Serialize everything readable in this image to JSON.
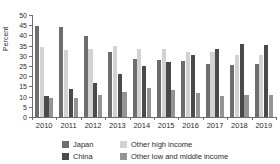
{
  "chart_data": {
    "type": "bar",
    "title": "",
    "subtitle": "",
    "xlabel": "",
    "ylabel": "Percent",
    "ylim": [
      0,
      50
    ],
    "ytick_step": 5,
    "yticks": [
      0,
      5,
      10,
      15,
      20,
      25,
      30,
      35,
      40,
      45,
      50
    ],
    "grid": false,
    "legend_position": "bottom",
    "categories": [
      "2010",
      "2011",
      "2012",
      "2013",
      "2014",
      "2015",
      "2016",
      "2017",
      "2018",
      "2019"
    ],
    "series": [
      {
        "name": "Japan",
        "color": "#6e6e6e",
        "values": [
          44.5,
          44.0,
          39.5,
          32.0,
          28.5,
          28.0,
          27.5,
          26.0,
          25.5,
          26.0
        ]
      },
      {
        "name": "Other high income",
        "color": "#d2d2d2",
        "values": [
          34.5,
          33.0,
          33.5,
          35.0,
          33.5,
          33.5,
          32.0,
          32.0,
          30.5,
          30.5
        ]
      },
      {
        "name": "China",
        "color": "#4a4a4a",
        "values": [
          10.5,
          13.5,
          16.5,
          21.0,
          25.0,
          27.0,
          30.5,
          33.5,
          36.0,
          35.5
        ]
      },
      {
        "name": "Other low and middle income",
        "color": "#949494",
        "values": [
          9.5,
          9.5,
          11.0,
          12.5,
          14.0,
          13.0,
          12.0,
          10.5,
          11.0,
          11.0
        ]
      }
    ]
  },
  "legend": {
    "items": [
      {
        "label": "Japan",
        "color": "#6e6e6e"
      },
      {
        "label": "Other high income",
        "color": "#d2d2d2"
      },
      {
        "label": "China",
        "color": "#4a4a4a"
      },
      {
        "label": "Other low and middle income",
        "color": "#949494"
      }
    ]
  }
}
